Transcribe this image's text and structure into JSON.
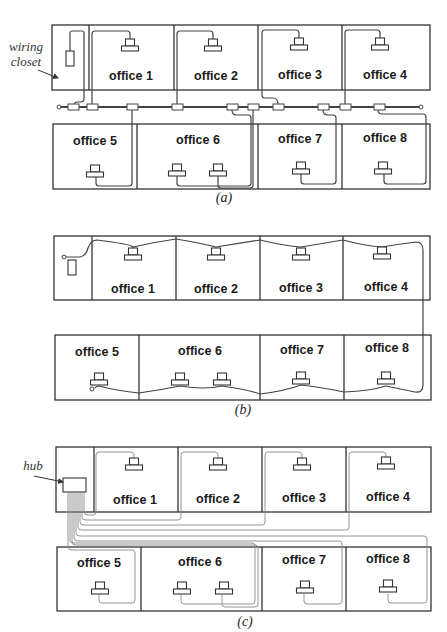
{
  "figure": {
    "panels": [
      {
        "id": "a",
        "caption": "(a)",
        "topology": "bus (thick coax with taps)",
        "annotation": "wiring closet",
        "offices_top": [
          "office 1",
          "office 2",
          "office 3",
          "office 4"
        ],
        "offices_bottom": [
          "office 5",
          "office 6",
          "office 7",
          "office 8"
        ]
      },
      {
        "id": "b",
        "caption": "(b)",
        "topology": "daisy-chained thin cable",
        "offices_top": [
          "office 1",
          "office 2",
          "office 3",
          "office 4"
        ],
        "offices_bottom": [
          "office 5",
          "office 6",
          "office 7",
          "office 8"
        ]
      },
      {
        "id": "c",
        "caption": "(c)",
        "topology": "star (hub)",
        "annotation": "hub",
        "offices_top": [
          "office 1",
          "office 2",
          "office 3",
          "office 4"
        ],
        "offices_bottom": [
          "office 5",
          "office 6",
          "office 7",
          "office 8"
        ]
      }
    ]
  },
  "colors": {
    "line": "#333333",
    "light_cable": "#888888",
    "background": "#ffffff"
  }
}
